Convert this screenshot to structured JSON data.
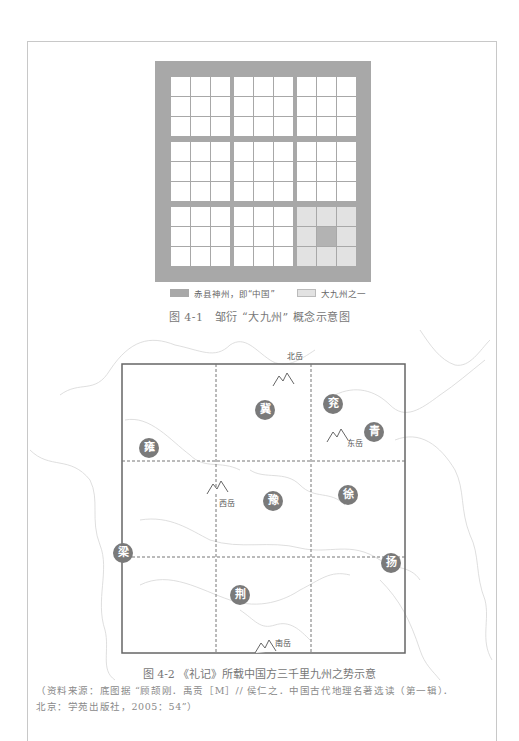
{
  "figure1": {
    "legend": [
      {
        "swatch": "dark",
        "label": "赤县神州，即“中国”"
      },
      {
        "swatch": "light",
        "label": "大九州之一"
      }
    ],
    "caption": "图 4-1　邹衍 “大九州” 概念示意图",
    "colors": {
      "grid_gray": "#a8a8a8",
      "light_block": "#e2e2e2",
      "cell": "#ffffff"
    }
  },
  "figure2": {
    "provinces": [
      {
        "name": "冀",
        "x": 265,
        "y": 410
      },
      {
        "name": "兖",
        "x": 333,
        "y": 404
      },
      {
        "name": "青",
        "x": 374,
        "y": 432
      },
      {
        "name": "雍",
        "x": 149,
        "y": 448
      },
      {
        "name": "豫",
        "x": 273,
        "y": 501
      },
      {
        "name": "徐",
        "x": 348,
        "y": 495
      },
      {
        "name": "梁",
        "x": 123,
        "y": 553
      },
      {
        "name": "扬",
        "x": 391,
        "y": 563
      },
      {
        "name": "荆",
        "x": 240,
        "y": 595
      }
    ],
    "mountains": [
      {
        "name": "北岳",
        "x": 283,
        "y": 381,
        "lx": 287,
        "ly": 350
      },
      {
        "name": "东岳",
        "x": 337,
        "y": 437,
        "lx": 347,
        "ly": 437
      },
      {
        "name": "西岳",
        "x": 217,
        "y": 489,
        "lx": 219,
        "ly": 497
      },
      {
        "name": "南岳",
        "x": 265,
        "y": 648,
        "lx": 275,
        "ly": 637
      }
    ],
    "caption": "图 4-2 《礼记》所载中国方三千里九州之势示意",
    "source_line1": "（资料来源：底图据 “顾颉刚．禹贡［M］// 侯仁之．中国古代地理名著选读（第一辑）．",
    "source_line2": "北京：学苑出版社，2005：54”）"
  }
}
